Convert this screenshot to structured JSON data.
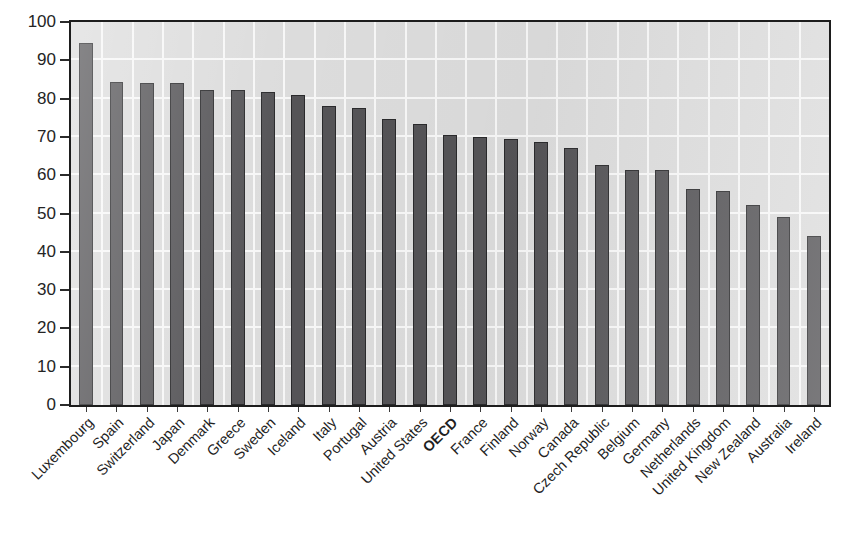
{
  "chart_data": {
    "type": "bar",
    "title": "",
    "subtitle": "",
    "xlabel": "",
    "ylabel": "",
    "ylim": [
      0,
      100
    ],
    "yticks": [
      0,
      10,
      20,
      30,
      40,
      50,
      60,
      70,
      80,
      90,
      100
    ],
    "ytick_labels": [
      "0",
      "10",
      "20",
      "30",
      "40",
      "50",
      "60",
      "70",
      "80",
      "90",
      "100"
    ],
    "grid": "both",
    "legend": "none",
    "bar_color": "#555457",
    "plot_background": "#dcdcdc",
    "gridline_color": "#f7f7f7",
    "frame_color": "#1d1d1d",
    "categories": [
      "Luxembourg",
      "Spain",
      "Switzerland",
      "Japan",
      "Denmark",
      "Greece",
      "Sweden",
      "Iceland",
      "Italy",
      "Portugal",
      "Austria",
      "United States",
      "OECD",
      "France",
      "Finland",
      "Norway",
      "Canada",
      "Czech Republic",
      "Belgium",
      "Germany",
      "Netherlands",
      "United Kingdom",
      "New Zealand",
      "Australia",
      "Ireland"
    ],
    "emphasized_categories": [
      "OECD"
    ],
    "values": [
      94.5,
      84.3,
      84.0,
      84.0,
      82.3,
      82.2,
      81.7,
      81.0,
      78.0,
      77.6,
      74.8,
      73.3,
      70.5,
      70.1,
      69.5,
      68.7,
      67.0,
      62.6,
      61.4,
      61.3,
      56.3,
      55.8,
      52.3,
      49.0,
      44.0
    ]
  },
  "caption": {
    "text": ""
  }
}
